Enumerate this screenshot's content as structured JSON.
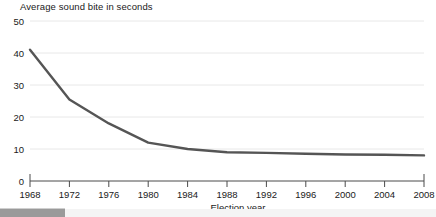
{
  "chart_data": {
    "type": "line",
    "title": "Average sound bite in seconds",
    "xlabel": "Election year",
    "ylabel": "",
    "x": [
      1968,
      1972,
      1976,
      1980,
      1984,
      1988,
      1992,
      1996,
      2000,
      2004,
      2008
    ],
    "values": [
      41,
      25.5,
      18,
      12,
      10,
      9,
      8.8,
      8.5,
      8.3,
      8.2,
      8
    ],
    "series": [
      {
        "name": "Average sound bite in seconds",
        "values": [
          41,
          25.5,
          18,
          12,
          10,
          9,
          8.8,
          8.5,
          8.3,
          8.2,
          8
        ]
      }
    ],
    "categories": [
      "1968",
      "1972",
      "1976",
      "1980",
      "1984",
      "1988",
      "1992",
      "1996",
      "2000",
      "2004",
      "2008"
    ],
    "xtick_labels": [
      "1968",
      "1972",
      "1976",
      "1980",
      "1984",
      "1988",
      "1992",
      "1996",
      "2000",
      "2004",
      "2008"
    ],
    "ytick_labels": [
      "0",
      "10",
      "20",
      "30",
      "40",
      "50"
    ],
    "yticks": [
      0,
      10,
      20,
      30,
      40,
      50
    ],
    "xlim": [
      1968,
      2008
    ],
    "ylim": [
      0,
      50
    ],
    "grid": "horizontal",
    "legend": "none",
    "line_color": "#555555",
    "gridline_color": "#e8e8e8",
    "axis_color": "#4a4a4a"
  },
  "scrollbar": {
    "orientation": "horizontal",
    "thumb_color": "#9a9a9a",
    "track_color": "#f4f4f4"
  }
}
